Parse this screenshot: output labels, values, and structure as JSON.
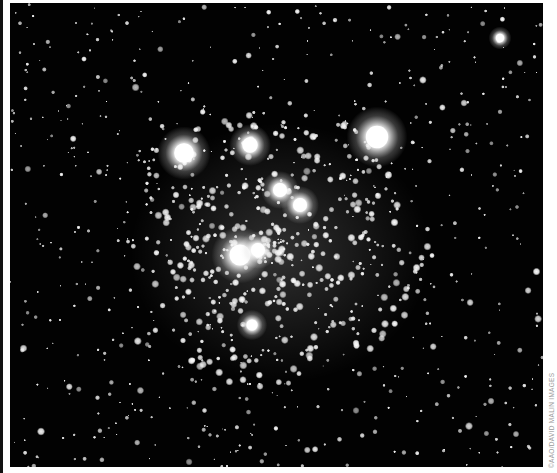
{
  "image": {
    "subject": "open star cluster photograph",
    "description": "Black-and-white astrophotograph of a dense star cluster with several bright foreground stars",
    "background_color": "#020202",
    "border_color": "#ffffff"
  },
  "credit": {
    "text": "©AAO/DAVID MALIN IMAGES"
  },
  "bright_stars": [
    {
      "x": 184,
      "y": 153,
      "r": 14
    },
    {
      "x": 250,
      "y": 145,
      "r": 11
    },
    {
      "x": 377,
      "y": 137,
      "r": 16
    },
    {
      "x": 280,
      "y": 190,
      "r": 10
    },
    {
      "x": 300,
      "y": 205,
      "r": 10
    },
    {
      "x": 240,
      "y": 255,
      "r": 15
    },
    {
      "x": 258,
      "y": 250,
      "r": 10
    },
    {
      "x": 252,
      "y": 325,
      "r": 8
    },
    {
      "x": 500,
      "y": 38,
      "r": 6
    }
  ]
}
